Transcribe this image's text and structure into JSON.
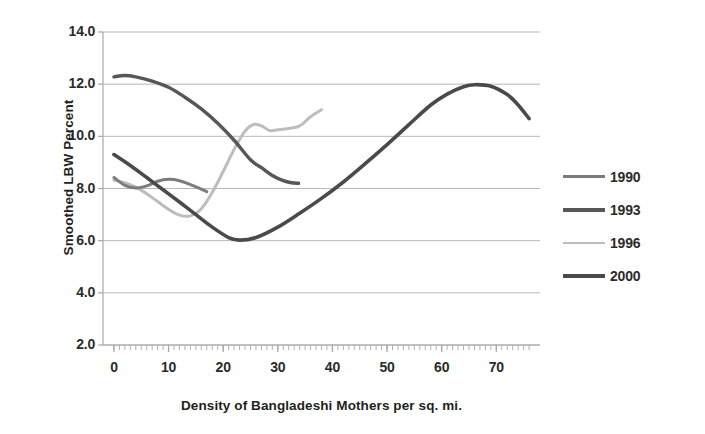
{
  "chart_data": {
    "type": "line",
    "title": "",
    "xlabel": "Density of Bangladeshi Mothers per sq. mi.",
    "ylabel": "Smoothed LBW Percent",
    "xlim": [
      -2,
      78
    ],
    "ylim": [
      2.0,
      14.0
    ],
    "xticks": [
      "0",
      "10",
      "20",
      "30",
      "40",
      "50",
      "60",
      "70"
    ],
    "xtick_values": [
      0,
      10,
      20,
      30,
      40,
      50,
      60,
      70
    ],
    "yticks": [
      "14.0",
      "12.0",
      "10.0",
      "8.0",
      "6.0",
      "4.0",
      "2.0"
    ],
    "ytick_values": [
      14.0,
      12.0,
      10.0,
      8.0,
      6.0,
      4.0,
      2.0
    ],
    "grid": "horizontal",
    "legend_position": "right",
    "series": [
      {
        "name": "1990",
        "color": "#7b7b7b",
        "width": 3.0,
        "x": [
          0,
          2,
          4,
          6,
          8,
          10,
          12,
          14,
          15.5,
          17
        ],
        "y": [
          8.42,
          8.12,
          8.02,
          8.1,
          8.28,
          8.35,
          8.3,
          8.15,
          8.02,
          7.88
        ]
      },
      {
        "name": "1993",
        "color": "#575757",
        "width": 3.4,
        "x": [
          0,
          2,
          4,
          7,
          10,
          13,
          16,
          19,
          22,
          25,
          27,
          29,
          31,
          32.5,
          33.8
        ],
        "y": [
          12.28,
          12.33,
          12.28,
          12.12,
          11.88,
          11.5,
          11.05,
          10.5,
          9.85,
          9.1,
          8.8,
          8.5,
          8.3,
          8.22,
          8.2
        ]
      },
      {
        "name": "1996",
        "color": "#bdbdbd",
        "width": 3.0,
        "x": [
          0,
          2,
          4,
          6,
          8,
          10,
          12,
          14,
          16,
          18,
          20,
          22,
          24,
          25.5,
          27,
          28.5,
          30,
          32,
          34,
          36,
          38
        ],
        "y": [
          8.32,
          8.22,
          8.05,
          7.8,
          7.5,
          7.2,
          6.98,
          6.95,
          7.22,
          7.85,
          8.65,
          9.5,
          10.2,
          10.45,
          10.4,
          10.22,
          10.25,
          10.3,
          10.4,
          10.75,
          11.02
        ]
      },
      {
        "name": "2000",
        "color": "#4a4a4a",
        "width": 3.6,
        "x": [
          0,
          3,
          6,
          9,
          12,
          15,
          18,
          21,
          23,
          26,
          30,
          34,
          38,
          42,
          46,
          50,
          54,
          58,
          61,
          64,
          66,
          69,
          72,
          74,
          76
        ],
        "y": [
          9.3,
          8.88,
          8.42,
          7.95,
          7.48,
          7.0,
          6.52,
          6.12,
          6.02,
          6.12,
          6.52,
          7.05,
          7.62,
          8.25,
          8.95,
          9.68,
          10.45,
          11.2,
          11.62,
          11.9,
          11.98,
          11.92,
          11.6,
          11.2,
          10.68
        ]
      }
    ]
  },
  "axes": {
    "y_title": "Smoothed LBW Percent",
    "x_title": "Density of Bangladeshi Mothers per sq. mi."
  },
  "legend": {
    "entries": [
      {
        "label": "1990",
        "color": "#7b7b7b",
        "width": "3px"
      },
      {
        "label": "1993",
        "color": "#575757",
        "width": "4px"
      },
      {
        "label": "1996",
        "color": "#bdbdbd",
        "width": "2.5px"
      },
      {
        "label": "2000",
        "color": "#4a4a4a",
        "width": "4px"
      }
    ]
  },
  "colors": {
    "background": "#ffffff",
    "gridline": "#b7b7b7",
    "axis": "#a8a8a8",
    "text": "#2b2b2b"
  }
}
